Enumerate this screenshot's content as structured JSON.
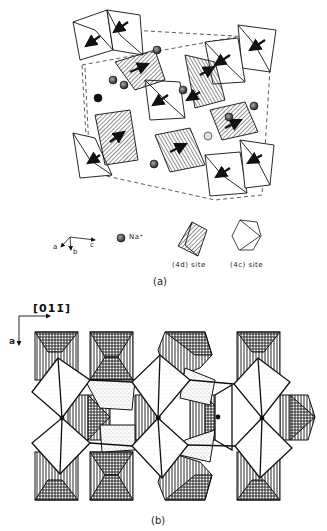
{
  "figure": {
    "panel_a": {
      "caption": "(a)",
      "axes": {
        "a_label": "a",
        "b_label": "b",
        "c_label": "c"
      },
      "legend": [
        {
          "symbol": "sodium-ion-sphere",
          "label": "Na⁺"
        },
        {
          "symbol": "hatched-octahedron",
          "label": "(4d) site"
        },
        {
          "symbol": "open-octahedron",
          "label": "(4c) site"
        }
      ]
    },
    "panel_b": {
      "caption": "(b)",
      "direction_label": "[011̄]",
      "axis_label": "a"
    },
    "colors": {
      "ink": "#111111",
      "background": "#ffffff",
      "stipple": "#bbbbbb"
    }
  }
}
